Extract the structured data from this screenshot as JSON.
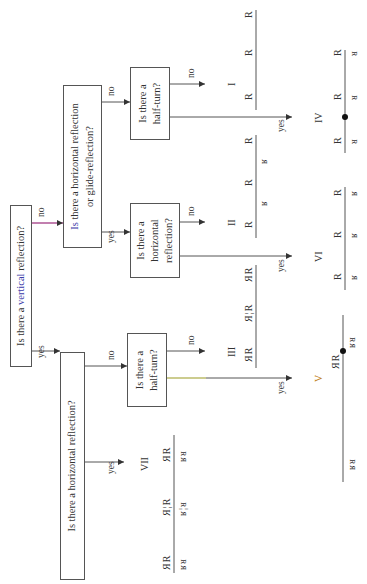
{
  "diagram": {
    "type": "flowchart",
    "orientation": "rotated 90deg counter-clockwise",
    "nodes": {
      "vertical": {
        "pre": "Is there a ",
        "hl": "vertical",
        "post": " reflection?"
      },
      "horiz_or_glide": {
        "line1_pre": "Is",
        "line1_post": " there a horizontal reflection",
        "line2": "or glide-reflection?"
      },
      "horiz_left": {
        "text": "Is there a horizontal reflection?"
      },
      "halfturn_top": {
        "line1": "Is there a",
        "line2": "half-turn?"
      },
      "horiz_mid": {
        "line1": "Is there a",
        "line2": "horizontal",
        "line3": "reflection?"
      },
      "halfturn_bottom": {
        "line1": "Is there a",
        "line2": "half-turn?"
      }
    },
    "edge_labels": {
      "yes": "yes",
      "no": "no"
    },
    "outcomes": {
      "I": "I",
      "II": "II",
      "III": "III",
      "IV": "IV",
      "V": "V",
      "VI": "VI",
      "VII": "VII"
    },
    "patterns": {
      "I": {
        "top": [
          "R",
          "R",
          "R"
        ]
      },
      "II": {
        "top": [
          "R",
          "R",
          "R"
        ],
        "bottom": [
          "ʁ",
          "ʁ"
        ]
      },
      "III": {
        "top": [
          "ЯR",
          "Я¦R",
          "ЯR"
        ]
      },
      "IV": {
        "top": [
          "R",
          "R",
          "R"
        ],
        "bottom": [
          "ᴚ",
          "ᴚ",
          "ᴚ"
        ]
      },
      "V": {
        "top": [
          "ЯR",
          "ЯR"
        ],
        "bottom": [
          "ʁᴚ",
          "ʁᴚ"
        ]
      },
      "VI": {
        "top": [
          "R",
          "R",
          "R"
        ],
        "bottom": [
          "ʁ",
          "ʁ",
          "ʁ"
        ]
      },
      "VII": {
        "top": [
          "ЯR",
          "Я¦R",
          "ЯR"
        ],
        "bottom": [
          "ʁᴚ",
          "ʁ¦ᴚ",
          "ʁᴚ"
        ]
      }
    },
    "colors": {
      "line": "#555555",
      "highlight_vertical": "#3a3aa8",
      "highlight_a": "#3c8a3c",
      "highlight_glide": "#b02030",
      "no_edge_top": "#9a2a7a",
      "yes_edge_halfturn": "#9a9a20",
      "roman_V": "#c08020"
    }
  }
}
